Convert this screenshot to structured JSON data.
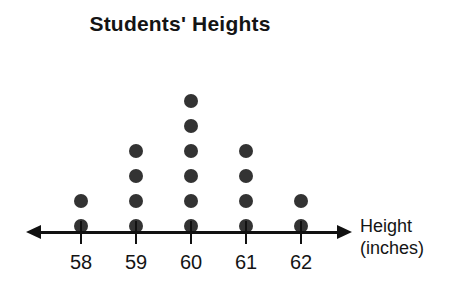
{
  "chart_data": {
    "type": "dotplot",
    "title": "Students' Heights",
    "xlabel_line1": "Height",
    "xlabel_line2": "(inches)",
    "ylabel": "",
    "categories": [
      "58",
      "59",
      "60",
      "61",
      "62"
    ],
    "values": [
      2,
      4,
      6,
      4,
      2
    ],
    "counts": {
      "58": 2,
      "59": 4,
      "60": 6,
      "61": 4,
      "62": 2
    },
    "total_observations": 18,
    "dot_value": 1,
    "xlim": [
      57.5,
      62.5
    ],
    "grid": false,
    "legend": null,
    "axis_style": "double-headed-arrow",
    "colors": {
      "dot": "#333333",
      "axis": "#111111",
      "text": "#141414",
      "background": "#ffffff"
    }
  },
  "figure": {
    "title": "Students' Heights",
    "axis": {
      "label_line1": "Height",
      "label_line2": "(inches)",
      "ticks": [
        {
          "label": "58",
          "count": 2
        },
        {
          "label": "59",
          "count": 4
        },
        {
          "label": "60",
          "count": 6
        },
        {
          "label": "61",
          "count": 4
        },
        {
          "label": "62",
          "count": 2
        }
      ]
    }
  }
}
